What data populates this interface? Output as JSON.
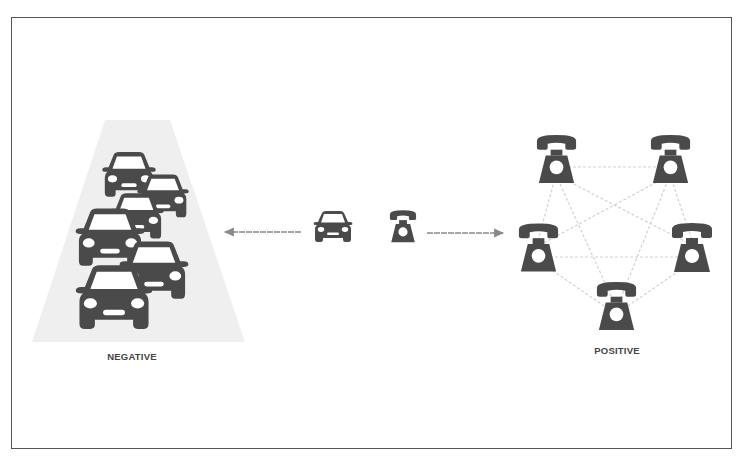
{
  "diagram": {
    "type": "comparison-network-effects",
    "colors": {
      "icon": "#4a4a4a",
      "road": "#efefef",
      "arrow": "#8a8a8a",
      "network_edge": "#d0d0d0",
      "label": "#444444",
      "frame": "#555555"
    },
    "left": {
      "label": "NEGATIVE",
      "icon": "car-icon",
      "description": "traffic jam of cars on a road (congestion)",
      "car_count": 6
    },
    "center": {
      "items": [
        {
          "icon": "car-icon",
          "name": "single-car"
        },
        {
          "icon": "telephone-icon",
          "name": "single-telephone"
        }
      ],
      "arrows": [
        {
          "direction": "left",
          "from": "single-car",
          "to": "negative-cluster"
        },
        {
          "direction": "right",
          "from": "single-telephone",
          "to": "positive-network"
        }
      ]
    },
    "right": {
      "label": "POSITIVE",
      "icon": "telephone-icon",
      "description": "fully connected network of telephones",
      "nodes": [
        "top-left",
        "top-right",
        "middle-left",
        "middle-right",
        "bottom"
      ],
      "edges": [
        [
          "top-left",
          "top-right"
        ],
        [
          "top-left",
          "middle-left"
        ],
        [
          "top-left",
          "middle-right"
        ],
        [
          "top-left",
          "bottom"
        ],
        [
          "top-right",
          "middle-left"
        ],
        [
          "top-right",
          "middle-right"
        ],
        [
          "top-right",
          "bottom"
        ],
        [
          "middle-left",
          "middle-right"
        ],
        [
          "middle-left",
          "bottom"
        ],
        [
          "middle-right",
          "bottom"
        ]
      ]
    }
  }
}
